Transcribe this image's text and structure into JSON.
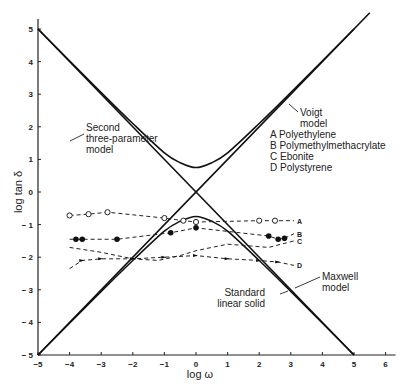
{
  "chart_data": {
    "type": "line",
    "title": "",
    "xlabel": "log ω",
    "ylabel": "log tan δ",
    "xlim": [
      -5,
      6
    ],
    "ylim": [
      -5,
      5
    ],
    "xticks": [
      -5,
      -4,
      -3,
      -2,
      -1,
      0,
      1,
      2,
      3,
      4,
      5,
      6
    ],
    "yticks": [
      -5,
      -4,
      -3,
      -2,
      -1,
      0,
      1,
      2,
      3,
      4,
      5
    ],
    "grid": false,
    "legend": {
      "position": "upper-right-inside",
      "entries": [
        "A Polyethylene",
        "B Polymethylmethacrylate",
        "C Ebonite",
        "D Polystyrene"
      ]
    },
    "model_curves": [
      {
        "name": "Voigt model",
        "style": "solid",
        "x": [
          -5,
          5.5
        ],
        "y": [
          -5,
          5.5
        ]
      },
      {
        "name": "Maxwell model",
        "style": "solid",
        "x": [
          -5,
          5
        ],
        "y": [
          5,
          -5
        ]
      },
      {
        "name": "Second three-parameter model",
        "style": "solid",
        "x": [
          -5,
          -3,
          -2,
          -1,
          -0.5,
          0,
          0.5,
          1,
          2,
          3,
          5
        ],
        "y": [
          5,
          3.05,
          2.1,
          1.2,
          0.9,
          0.75,
          0.9,
          1.2,
          2.1,
          3.05,
          5
        ]
      },
      {
        "name": "Standard linear solid",
        "style": "solid",
        "x": [
          -5,
          -3,
          -2,
          -1,
          -0.5,
          0,
          0.5,
          1,
          2,
          3,
          5
        ],
        "y": [
          -5,
          -3.05,
          -2.1,
          -1.2,
          -0.9,
          -0.75,
          -0.9,
          -1.2,
          -2.1,
          -3.05,
          -5
        ]
      }
    ],
    "series": [
      {
        "name": "A",
        "label": "Polyethylene",
        "marker": "open-circle",
        "style": "dashed",
        "x": [
          -4.0,
          -3.4,
          -2.8,
          -1.0,
          -0.4,
          0.0,
          2.0,
          2.5,
          3.1
        ],
        "y": [
          -0.72,
          -0.68,
          -0.62,
          -0.8,
          -0.88,
          -0.92,
          -0.88,
          -0.88,
          -0.88
        ]
      },
      {
        "name": "B",
        "label": "Polymethylmethacrylate",
        "marker": "filled-circle",
        "style": "dashed",
        "x": [
          -4.0,
          -3.8,
          -3.6,
          -2.5,
          -0.8,
          0.0,
          2.3,
          2.6,
          2.8,
          3.1
        ],
        "y": [
          -1.45,
          -1.45,
          -1.45,
          -1.45,
          -1.25,
          -1.1,
          -1.35,
          -1.45,
          -1.42,
          -1.28
        ]
      },
      {
        "name": "C",
        "label": "Ebonite",
        "marker": "none",
        "style": "dashed",
        "x": [
          -4.0,
          -3.0,
          -2.0,
          -1.2,
          -0.5,
          0.0,
          1.0,
          2.3,
          2.7,
          3.1
        ],
        "y": [
          -1.7,
          -1.85,
          -2.05,
          -2.1,
          -1.95,
          -1.8,
          -1.6,
          -1.7,
          -1.6,
          -1.5
        ]
      },
      {
        "name": "D",
        "label": "Polystyrene",
        "marker": "arrow-triangle",
        "style": "dashed",
        "x": [
          -4.0,
          -3.6,
          -3.0,
          -2.0,
          -1.0,
          0.0,
          1.0,
          2.0,
          2.6,
          3.1
        ],
        "y": [
          -2.35,
          -2.1,
          -2.05,
          -2.05,
          -2.0,
          -1.95,
          -2.05,
          -2.1,
          -2.15,
          -2.25
        ]
      }
    ],
    "annotations": [
      {
        "text_lines": [
          "Second",
          "three-parameter",
          "model"
        ],
        "points_to": "Second three-parameter model"
      },
      {
        "text_lines": [
          "Voigt",
          "model"
        ],
        "points_to": "Voigt model"
      },
      {
        "text_lines": [
          "Maxwell",
          "model"
        ],
        "points_to": "Maxwell model"
      },
      {
        "text_lines": [
          "Standard",
          "linear solid"
        ],
        "points_to": "Standard linear solid"
      }
    ]
  }
}
